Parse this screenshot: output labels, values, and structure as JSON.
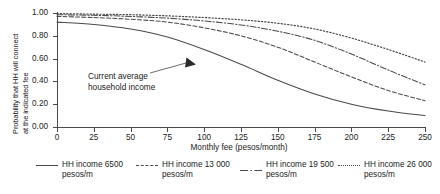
{
  "chart_data": {
    "type": "line",
    "title": "",
    "xlabel": "Monthly fee (pesos/month)",
    "ylabel_line1": "Probability that HH will connect",
    "ylabel_line2": "at the indicated fee",
    "xlim": [
      0,
      250
    ],
    "ylim": [
      0.0,
      1.0
    ],
    "grid": false,
    "legend_position": "bottom",
    "xticks": [
      "0",
      "25",
      "50",
      "75",
      "100",
      "125",
      "150",
      "175",
      "200",
      "225",
      "250"
    ],
    "xtick_values": [
      0,
      25,
      50,
      75,
      100,
      125,
      150,
      175,
      200,
      225,
      250
    ],
    "yticks": [
      "0.00",
      "0.20",
      "0.40",
      "0.60",
      "0.80",
      "1.00"
    ],
    "ytick_values": [
      0.0,
      0.2,
      0.4,
      0.6,
      0.8,
      1.0
    ],
    "x": [
      0,
      25,
      50,
      75,
      100,
      125,
      150,
      175,
      200,
      225,
      250
    ],
    "series": [
      {
        "name": "HH income 6500 pesos/m",
        "label_line1": "HH income 6500",
        "label_line2": "pesos/m",
        "style": "solid",
        "color": "#4a4a4a",
        "values": [
          0.92,
          0.9,
          0.86,
          0.79,
          0.68,
          0.55,
          0.41,
          0.29,
          0.2,
          0.14,
          0.1
        ]
      },
      {
        "name": "HH income 13 000 pesos/m",
        "label_line1": "HH income 13 000",
        "label_line2": "pesos/m",
        "style": "dashed",
        "color": "#4a4a4a",
        "values": [
          0.97,
          0.96,
          0.945,
          0.92,
          0.87,
          0.8,
          0.7,
          0.57,
          0.44,
          0.32,
          0.23
        ]
      },
      {
        "name": "HH income 19 500 pesos/m",
        "label_line1": "HH income 19 500",
        "label_line2": "pesos/m",
        "style": "dash-dot",
        "color": "#4a4a4a",
        "values": [
          0.985,
          0.98,
          0.97,
          0.955,
          0.93,
          0.895,
          0.84,
          0.76,
          0.64,
          0.5,
          0.37
        ]
      },
      {
        "name": "HH income 26 000 pesos/m",
        "label_line1": "HH income 26 000",
        "label_line2": "pesos/m",
        "style": "dotted",
        "color": "#4a4a4a",
        "values": [
          0.995,
          0.99,
          0.985,
          0.975,
          0.96,
          0.94,
          0.91,
          0.86,
          0.78,
          0.68,
          0.57
        ]
      }
    ],
    "annotations": [
      {
        "text_line1": "Current average",
        "text_line2": "household income",
        "arrow_from": [
          88,
          127
        ],
        "arrow_to": [
          132,
          78
        ]
      }
    ]
  }
}
